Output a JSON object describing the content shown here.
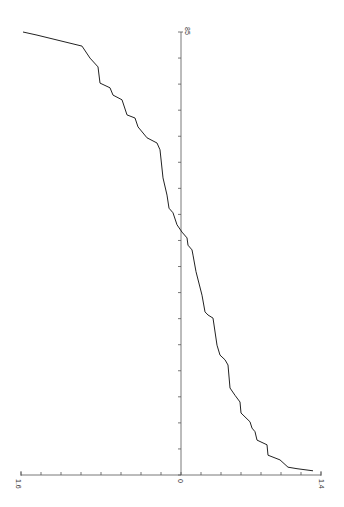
{
  "chart_data": {
    "type": "line",
    "title": "",
    "orientation": "rotated-90",
    "xlabel": "",
    "ylabel": "",
    "index_axis": {
      "range": [
        0,
        85
      ],
      "tick_step": 5,
      "labels": [
        {
          "value": 85,
          "text": "85"
        }
      ]
    },
    "value_axis": {
      "range": [
        -1.6,
        1.4
      ],
      "tick_step": 0.2,
      "labels": [
        {
          "value": -1.6,
          "text": "1.6"
        },
        {
          "value": 0,
          "text": "0"
        },
        {
          "value": 1.4,
          "text": "1.4"
        }
      ]
    },
    "grid": false,
    "legend": null,
    "series": [
      {
        "name": "sorted values",
        "color": "#222222",
        "points": [
          [
            0.8,
            1.32
          ],
          [
            1.2,
            1.16
          ],
          [
            1.5,
            1.07
          ],
          [
            2.9,
            0.99
          ],
          [
            3.8,
            0.87
          ],
          [
            5.8,
            0.86
          ],
          [
            6.7,
            0.76
          ],
          [
            8.3,
            0.74
          ],
          [
            9.0,
            0.71
          ],
          [
            10.2,
            0.69
          ],
          [
            11.9,
            0.6
          ],
          [
            14.0,
            0.59
          ],
          [
            15.3,
            0.54
          ],
          [
            16.7,
            0.49
          ],
          [
            21.1,
            0.47
          ],
          [
            22.1,
            0.44
          ],
          [
            23.0,
            0.39
          ],
          [
            24.9,
            0.36
          ],
          [
            30.1,
            0.32
          ],
          [
            30.7,
            0.27
          ],
          [
            31.3,
            0.24
          ],
          [
            34.5,
            0.21
          ],
          [
            39.0,
            0.15
          ],
          [
            42.2,
            0.12
          ],
          [
            43.2,
            0.11
          ],
          [
            44.1,
            0.07
          ],
          [
            45.5,
            0.06
          ],
          [
            46.6,
            0.01
          ],
          [
            48.0,
            -0.04
          ],
          [
            50.3,
            -0.08
          ],
          [
            51.2,
            -0.12
          ],
          [
            53.7,
            -0.14
          ],
          [
            57.0,
            -0.18
          ],
          [
            62.4,
            -0.21
          ],
          [
            63.7,
            -0.24
          ],
          [
            64.7,
            -0.34
          ],
          [
            66.8,
            -0.43
          ],
          [
            68.5,
            -0.46
          ],
          [
            69.1,
            -0.54
          ],
          [
            72.0,
            -0.59
          ],
          [
            72.9,
            -0.68
          ],
          [
            74.3,
            -0.71
          ],
          [
            75.2,
            -0.81
          ],
          [
            78.3,
            -0.83
          ],
          [
            80.0,
            -0.91
          ],
          [
            82.3,
            -0.99
          ],
          [
            84.4,
            -1.44
          ],
          [
            85.0,
            -1.58
          ]
        ]
      }
    ]
  },
  "axes": {
    "value_min_label": "1.6",
    "value_zero_label": "0",
    "value_max_label": "1.4",
    "index_max_label": "85"
  }
}
